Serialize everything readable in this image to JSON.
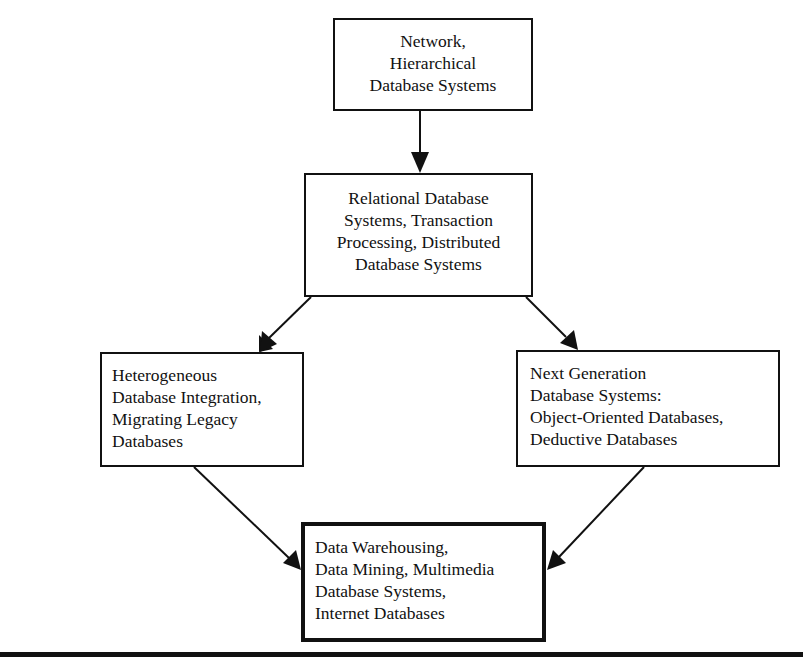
{
  "diagram": {
    "type": "flow-diagram",
    "title": "",
    "nodes": [
      {
        "id": "top",
        "lines": [
          "Network,",
          "Hierarchical",
          "Database Systems"
        ]
      },
      {
        "id": "relational",
        "lines": [
          "Relational Database",
          "Systems, Transaction",
          "Processing, Distributed",
          "Database Systems"
        ]
      },
      {
        "id": "hetero",
        "lines": [
          "Heterogeneous",
          "Database Integration,",
          "Migrating Legacy",
          "Databases"
        ]
      },
      {
        "id": "nextgen",
        "lines": [
          "Next Generation",
          "Database Systems:",
          "Object-Oriented Databases,",
          "Deductive Databases"
        ]
      },
      {
        "id": "warehouse",
        "lines": [
          "Data Warehousing,",
          "Data Mining, Multimedia",
          "Database Systems,",
          "Internet Databases"
        ]
      }
    ],
    "edges": [
      {
        "from": "top",
        "to": "relational"
      },
      {
        "from": "relational",
        "to": "hetero"
      },
      {
        "from": "relational",
        "to": "nextgen"
      },
      {
        "from": "hetero",
        "to": "warehouse"
      },
      {
        "from": "nextgen",
        "to": "warehouse"
      }
    ],
    "colors": {
      "stroke": "#111111",
      "background": "#ffffff",
      "text": "#111111"
    }
  }
}
